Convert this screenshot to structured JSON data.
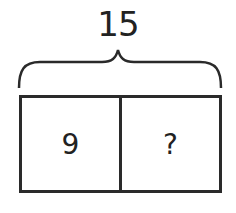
{
  "diagram": {
    "total_label": "15",
    "parts": [
      {
        "label": "9"
      },
      {
        "label": "?"
      }
    ]
  }
}
